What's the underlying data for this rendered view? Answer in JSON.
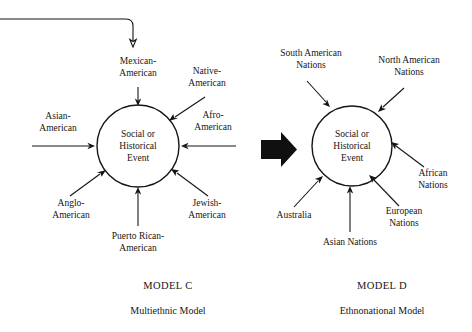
{
  "figure": {
    "background_color": "#ffffff",
    "ink_color": "#151515"
  },
  "model_c": {
    "center_label_lines": [
      "Social or",
      "Historical",
      "Event"
    ],
    "caption_title": "MODEL C",
    "caption_subtitle": "Multiethnic Model",
    "inflow_labels": [
      {
        "id": "mexican-american",
        "lines": [
          "Mexican-",
          "American"
        ],
        "direction": "down"
      },
      {
        "id": "native-american",
        "lines": [
          "Native-",
          "American"
        ],
        "direction": "down-left"
      },
      {
        "id": "afro-american",
        "lines": [
          "Afro-",
          "American"
        ],
        "direction": "left"
      },
      {
        "id": "jewish-american",
        "lines": [
          "Jewish-",
          "American"
        ],
        "direction": "up-left"
      },
      {
        "id": "puerto-rican-american",
        "lines": [
          "Puerto Rican-",
          "American"
        ],
        "direction": "up"
      },
      {
        "id": "anglo-american",
        "lines": [
          "Anglo-",
          "American"
        ],
        "direction": "up-right"
      },
      {
        "id": "asian-american",
        "lines": [
          "Asian-",
          "American"
        ],
        "direction": "right"
      }
    ],
    "top_connector": {
      "id": "external-inflow-connector",
      "description": "line entering from left edge, turning down into Mexican-American"
    }
  },
  "model_d": {
    "center_label_lines": [
      "Social or",
      "Historical",
      "Event"
    ],
    "caption_title": "MODEL D",
    "caption_subtitle": "Ethnonational Model",
    "inflow_labels": [
      {
        "id": "south-american-nations",
        "lines": [
          "South American",
          "Nations"
        ],
        "direction": "down-right"
      },
      {
        "id": "north-american-nations",
        "lines": [
          "North American",
          "Nations"
        ],
        "direction": "down-left"
      },
      {
        "id": "african-nations",
        "lines": [
          "African",
          "Nations"
        ],
        "direction": "up-left"
      },
      {
        "id": "european-nations",
        "lines": [
          "European",
          "Nations"
        ],
        "direction": "up-left"
      },
      {
        "id": "asian-nations",
        "lines": [
          "Asian Nations"
        ],
        "direction": "up"
      },
      {
        "id": "australia",
        "lines": [
          "Australia"
        ],
        "direction": "up-right"
      }
    ]
  },
  "transition": {
    "id": "model-c-to-model-d-arrow",
    "label": "",
    "color": "#101010"
  }
}
